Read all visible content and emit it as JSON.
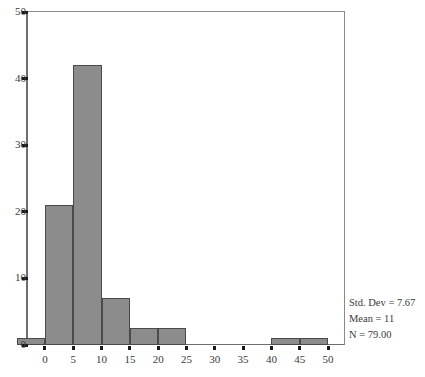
{
  "chart_data": {
    "type": "bar",
    "title": "",
    "subtitle": "",
    "xlabel": "",
    "ylabel": "",
    "xlim": [
      -3,
      53
    ],
    "ylim": [
      0,
      50
    ],
    "grid": false,
    "legend": null,
    "bin_width": 5,
    "categories": [
      "-2.5",
      "2.5",
      "7.5",
      "12.5",
      "17.5",
      "22.5",
      "27.5",
      "32.5",
      "37.5",
      "42.5",
      "47.5"
    ],
    "bin_edges": [
      -5,
      0,
      5,
      10,
      15,
      20,
      25,
      30,
      35,
      40,
      45,
      50
    ],
    "values": [
      1,
      21,
      42,
      7,
      2.5,
      2.5,
      0,
      0,
      0,
      1,
      1
    ],
    "xticks": [
      0,
      5,
      10,
      15,
      20,
      25,
      30,
      35,
      40,
      45,
      50
    ],
    "xtick_labels": [
      "0",
      "5",
      "10",
      "15",
      "20",
      "25",
      "30",
      "35",
      "40",
      "45",
      "50"
    ],
    "yticks": [
      0,
      10,
      20,
      30,
      40,
      50
    ],
    "ytick_labels": [
      "0",
      "10",
      "20",
      "30",
      "40",
      "50"
    ],
    "bar_color": "#8c8c8c",
    "bar_edge_color": "#4a4a4a",
    "annotations": [
      "Std. Dev = 7.67",
      "Mean = 11",
      "N = 79.00"
    ]
  },
  "stats": {
    "std_dev": "Std. Dev = 7.67",
    "mean": "Mean = 11",
    "n": "N = 79.00"
  }
}
